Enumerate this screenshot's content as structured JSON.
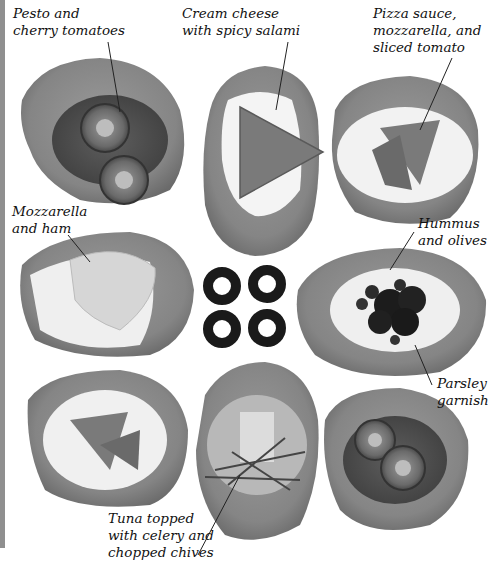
{
  "figure": {
    "labels": {
      "pesto": "Pesto and\ncherry tomatoes",
      "cream_cheese": "Cream cheese\nwith spicy salami",
      "pizza": "Pizza sauce,\nmozzarella, and\nsliced tomato",
      "mozzarella_ham": "Mozzarella\nand ham",
      "hummus": "Hummus\nand olives",
      "parsley": "Parsley\ngarnish",
      "tuna": "Tuna topped\nwith celery and\nchopped chives"
    },
    "colors": {
      "bread": "#8a8a8a",
      "bread_crust": "#6e6e6e",
      "cheese": "#f2f2f2",
      "tomato": "#5a5a5a",
      "olive": "#1a1a1a",
      "leader_line": "#222222"
    }
  }
}
